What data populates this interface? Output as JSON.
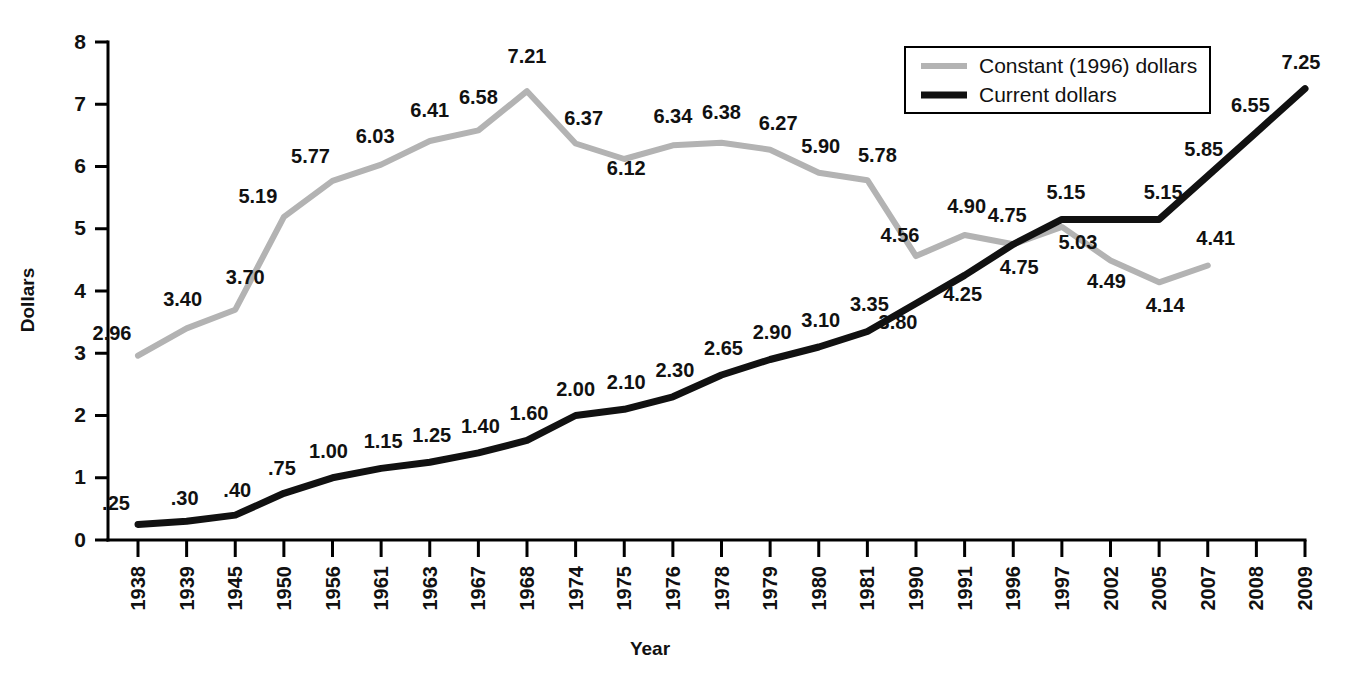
{
  "chart_data": {
    "type": "line",
    "title": "",
    "xlabel": "Year",
    "ylabel": "Dollars",
    "ylim": [
      0,
      8
    ],
    "yticks": [
      "0",
      "1",
      "2",
      "3",
      "4",
      "5",
      "6",
      "7",
      "8"
    ],
    "grid": false,
    "legend_position": "top-right",
    "categories": [
      "1938",
      "1939",
      "1945",
      "1950",
      "1956",
      "1961",
      "1963",
      "1967",
      "1968",
      "1974",
      "1975",
      "1976",
      "1978",
      "1979",
      "1980",
      "1981",
      "1990",
      "1991",
      "1996",
      "1997",
      "2002",
      "2005",
      "2007",
      "2008",
      "2009"
    ],
    "series": [
      {
        "name": "Constant (1996) dollars",
        "color": "#b3b3b3",
        "values": [
          2.96,
          3.4,
          3.7,
          5.19,
          5.77,
          6.03,
          6.41,
          6.58,
          7.21,
          6.37,
          6.12,
          6.34,
          6.38,
          6.27,
          5.9,
          5.78,
          4.56,
          4.9,
          4.75,
          5.03,
          4.49,
          4.14,
          4.41,
          null,
          null
        ],
        "labels": [
          "2.96",
          "3.40",
          "3.70",
          "5.19",
          "5.77",
          "6.03",
          "6.41",
          "6.58",
          "7.21",
          "6.37",
          "6.12",
          "6.34",
          "6.38",
          "6.27",
          "5.90",
          "5.78",
          "4.56",
          "4.90",
          "4.75",
          "5.03",
          "4.49",
          "4.14",
          "4.41",
          "",
          ""
        ]
      },
      {
        "name": "Current dollars",
        "color": "#111111",
        "values": [
          0.25,
          0.3,
          0.4,
          0.75,
          1.0,
          1.15,
          1.25,
          1.4,
          1.6,
          2.0,
          2.1,
          2.3,
          2.65,
          2.9,
          3.1,
          3.35,
          3.8,
          4.25,
          4.75,
          5.15,
          5.15,
          5.15,
          5.85,
          6.55,
          7.25
        ],
        "labels": [
          ".25",
          ".30",
          ".40",
          ".75",
          "1.00",
          "1.15",
          "1.25",
          "1.40",
          "1.60",
          "2.00",
          "2.10",
          "2.30",
          "2.65",
          "2.90",
          "3.10",
          "3.35",
          "3.80",
          "4.25",
          "4.75",
          "5.15",
          "",
          "5.15",
          "5.85",
          "6.55",
          "7.25"
        ]
      }
    ]
  },
  "legend": {
    "items": [
      {
        "label": "Constant (1996) dollars",
        "color": "#b3b3b3"
      },
      {
        "label": "Current dollars",
        "color": "#111111"
      }
    ]
  },
  "axes": {
    "y_title": "Dollars",
    "x_title": "Year"
  }
}
